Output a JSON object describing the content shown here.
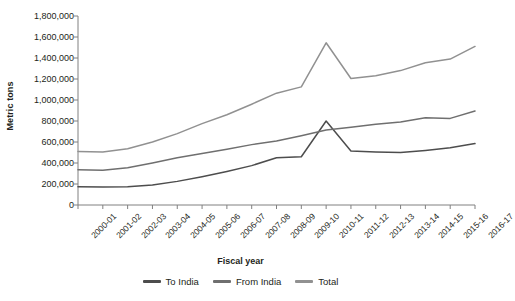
{
  "chart_data": {
    "type": "line",
    "title": "",
    "xlabel": "Fiscal year",
    "ylabel": "Metric tons",
    "ylim": [
      0,
      1800000
    ],
    "ytick_step": 200000,
    "grid": false,
    "legend_position": "bottom",
    "categories": [
      "2000-01",
      "2001-02",
      "2002-03",
      "2003-04",
      "2004-05",
      "2005-06",
      "2006-07",
      "2007-08",
      "2008-09",
      "2009-10",
      "2010-11",
      "2011-12",
      "2012-13",
      "2013-14",
      "2014-15",
      "2015-16",
      "2016-17"
    ],
    "ytick_labels": [
      "0",
      "200,000",
      "400,000",
      "600,000",
      "800,000",
      "1,000,000",
      "1,200,000",
      "1,400,000",
      "1,600,000",
      "1,800,000"
    ],
    "series": [
      {
        "name": "To India",
        "color": "#4d4d4d",
        "values": [
          175000,
          172000,
          175000,
          190000,
          225000,
          270000,
          320000,
          375000,
          450000,
          460000,
          800000,
          515000,
          505000,
          500000,
          520000,
          545000,
          585000
        ]
      },
      {
        "name": "From India",
        "color": "#6f6f6f",
        "values": [
          335000,
          330000,
          355000,
          400000,
          450000,
          490000,
          530000,
          575000,
          610000,
          660000,
          715000,
          740000,
          770000,
          790000,
          830000,
          825000,
          895000
        ]
      },
      {
        "name": "Total",
        "color": "#919191",
        "values": [
          510000,
          505000,
          535000,
          600000,
          680000,
          775000,
          860000,
          960000,
          1065000,
          1125000,
          1545000,
          1205000,
          1230000,
          1280000,
          1355000,
          1390000,
          1510000
        ]
      }
    ]
  },
  "legend": [
    {
      "label": "To India"
    },
    {
      "label": "From India"
    },
    {
      "label": "Total"
    }
  ],
  "axis": {
    "color": "#808080"
  }
}
